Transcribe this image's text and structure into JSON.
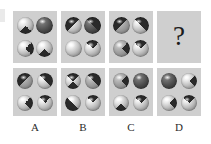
{
  "puzzle": {
    "type": "visual-analogy-matrix",
    "question_symbol": "?",
    "sphere_fills": {
      "light": "#c9c9c9",
      "mid": "#9a9a9a",
      "dark": "#3a3a3a",
      "marking": "#2a2a2a"
    },
    "panel_background": "#cfcfcf",
    "page_background": "#ffffff"
  },
  "top_row": [
    {
      "name": "sequence-panel-1",
      "spheres": [
        {
          "position": "top-left",
          "shade": "light",
          "mark": "top-wedge"
        },
        {
          "position": "top-right",
          "shade": "dark",
          "mark": "solid"
        },
        {
          "position": "bottom-left",
          "shade": "light",
          "mark": "left-wedge"
        },
        {
          "position": "bottom-right",
          "shade": "light",
          "mark": "top-wedge"
        }
      ]
    },
    {
      "name": "sequence-panel-2",
      "spheres": [
        {
          "position": "top-left",
          "shade": "light",
          "mark": "diag-ul"
        },
        {
          "position": "top-right",
          "shade": "dark",
          "mark": "diag-ur"
        },
        {
          "position": "bottom-left",
          "shade": "light",
          "mark": "none"
        },
        {
          "position": "bottom-right",
          "shade": "light",
          "mark": "bottom-wedge"
        }
      ]
    },
    {
      "name": "sequence-panel-3",
      "spheres": [
        {
          "position": "top-left",
          "shade": "mid",
          "mark": "diag-ul"
        },
        {
          "position": "top-right",
          "shade": "light",
          "mark": "diag-ur"
        },
        {
          "position": "bottom-left",
          "shade": "mid",
          "mark": "left-wedge"
        },
        {
          "position": "bottom-right",
          "shade": "light",
          "mark": "bottom-wedge"
        }
      ]
    },
    {
      "name": "question-panel",
      "spheres": []
    }
  ],
  "options": [
    {
      "label": "A",
      "name": "option-a",
      "spheres": [
        {
          "position": "top-left",
          "shade": "mid",
          "mark": "diag-ul"
        },
        {
          "position": "top-right",
          "shade": "light",
          "mark": "diag-ur"
        },
        {
          "position": "bottom-left",
          "shade": "light",
          "mark": "left-wedge"
        },
        {
          "position": "bottom-right",
          "shade": "light",
          "mark": "bottom-wedge"
        }
      ]
    },
    {
      "label": "B",
      "name": "option-b",
      "spheres": [
        {
          "position": "top-left",
          "shade": "light",
          "mark": "bowtie"
        },
        {
          "position": "top-right",
          "shade": "mid",
          "mark": "diag-ur"
        },
        {
          "position": "bottom-left",
          "shade": "light",
          "mark": "diag-ll"
        },
        {
          "position": "bottom-right",
          "shade": "light",
          "mark": "bottom-wedge"
        }
      ]
    },
    {
      "label": "C",
      "name": "option-c",
      "spheres": [
        {
          "position": "top-left",
          "shade": "mid",
          "mark": "left-wedge"
        },
        {
          "position": "top-right",
          "shade": "dark",
          "mark": "solid"
        },
        {
          "position": "bottom-left",
          "shade": "light",
          "mark": "top-wedge"
        },
        {
          "position": "bottom-right",
          "shade": "light",
          "mark": "bottom-wedge"
        }
      ]
    },
    {
      "label": "D",
      "name": "option-d",
      "spheres": [
        {
          "position": "top-left",
          "shade": "dark",
          "mark": "solid"
        },
        {
          "position": "top-right",
          "shade": "light",
          "mark": "left-wedge"
        },
        {
          "position": "bottom-left",
          "shade": "light",
          "mark": "left-wedge"
        },
        {
          "position": "bottom-right",
          "shade": "light",
          "mark": "bottom-wedge"
        }
      ]
    }
  ]
}
